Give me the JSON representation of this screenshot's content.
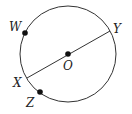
{
  "diagram": {
    "type": "circle-geometry",
    "circle": {
      "center_label": "O",
      "cx": 68,
      "cy": 54,
      "r": 48
    },
    "segments": [
      {
        "from": "X",
        "to": "Y",
        "kind": "diameter"
      }
    ],
    "points": [
      {
        "id": "W",
        "label": "W",
        "x": 25,
        "y": 33,
        "lx": 9,
        "ly": 31
      },
      {
        "id": "Y",
        "label": "Y",
        "x": 110,
        "y": 31,
        "lx": 113,
        "ly": 33
      },
      {
        "id": "O",
        "label": "O",
        "x": 68,
        "y": 54,
        "lx": 63,
        "ly": 70
      },
      {
        "id": "X",
        "label": "X",
        "x": 27,
        "y": 78,
        "lx": 13,
        "ly": 87
      },
      {
        "id": "Z",
        "label": "Z",
        "x": 40,
        "y": 92,
        "lx": 26,
        "ly": 107
      }
    ],
    "colors": {
      "stroke": "#333333",
      "dot": "#111111"
    }
  }
}
